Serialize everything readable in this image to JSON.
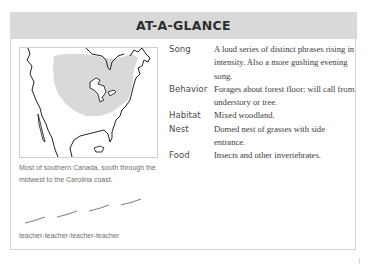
{
  "card": {
    "title": "AT-A-GLANCE"
  },
  "map": {
    "icon": "range-map-north-america",
    "range_color": "#d9d9d9",
    "outline_color": "#222222",
    "caption": "Most of southern Canada, south through the midwest to the Carolina coast."
  },
  "song_graph": {
    "icon": "sonogram-dashes",
    "color": "#8a8a8a",
    "segments": 4,
    "caption": "teacher-teacher-teacher-teacher"
  },
  "facts": [
    {
      "label": "Song",
      "value": "A loud series of distinct phrases rising in intensity. Also a more gushing evening song."
    },
    {
      "label": "Behavior",
      "value": "Forages about forest floor; will call from understory or tree."
    },
    {
      "label": "Habitat",
      "value": "Mixed woodland."
    },
    {
      "label": "Nest",
      "value": "Domed nest of grasses with side entrance."
    },
    {
      "label": "Food",
      "value": "Insects and other invertebrates."
    }
  ],
  "colors": {
    "header_bg": "#d9d9d9",
    "border": "#d4d4d4",
    "text": "#3a3a3a",
    "caption_text": "#6d6d6d"
  }
}
